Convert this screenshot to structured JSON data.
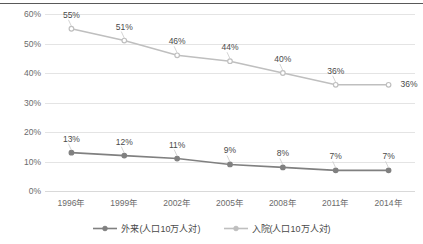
{
  "chart_data": {
    "type": "line",
    "title": "",
    "xlabel": "",
    "ylabel": "",
    "ylim": [
      0,
      60
    ],
    "y_tick_step": 10,
    "grid": true,
    "legend_position": "bottom",
    "categories": [
      "1996年",
      "1999年",
      "2002年",
      "2005年",
      "2008年",
      "2011年",
      "2014年"
    ],
    "y_ticks": [
      "0%",
      "10%",
      "20%",
      "30%",
      "40%",
      "50%",
      "60%"
    ],
    "series": [
      {
        "name": "入院(人口10万人対)",
        "color": "#bfbfbf",
        "marker": "circle",
        "values": [
          55,
          51,
          46,
          44,
          40,
          36,
          36
        ],
        "labels": [
          "55%",
          "51%",
          "46%",
          "44%",
          "40%",
          "36%",
          "36%"
        ]
      },
      {
        "name": "外来(人口10万人対)",
        "color": "#808080",
        "marker": "circle",
        "values": [
          13,
          12,
          11,
          9,
          8,
          7,
          7
        ],
        "labels": [
          "13%",
          "12%",
          "11%",
          "9%",
          "8%",
          "7%",
          "7%"
        ]
      }
    ]
  },
  "legend": {
    "items": [
      {
        "label": "外来(人口10万人対)",
        "color": "#808080"
      },
      {
        "label": "入院(人口10万人対)",
        "color": "#bfbfbf"
      }
    ]
  }
}
